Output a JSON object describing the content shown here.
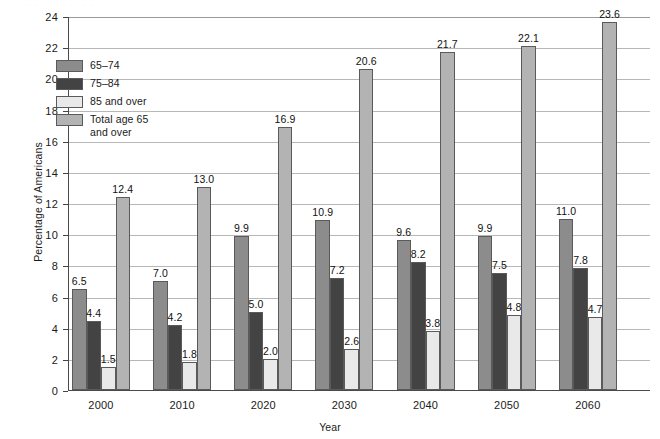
{
  "chart_data": {
    "type": "bar",
    "title": "",
    "xlabel": "Year",
    "ylabel": "Percentage of Americans",
    "categories": [
      "2000",
      "2010",
      "2020",
      "2030",
      "2040",
      "2050",
      "2060"
    ],
    "series": [
      {
        "name": "65–74",
        "values": [
          6.5,
          7.0,
          9.9,
          10.9,
          9.6,
          9.9,
          11.0
        ],
        "color": "#8c8c8c"
      },
      {
        "name": "75–84",
        "values": [
          4.4,
          4.2,
          5.0,
          7.2,
          8.2,
          7.5,
          7.8
        ],
        "color": "#434343"
      },
      {
        "name": "85 and over",
        "values": [
          1.5,
          1.8,
          2.0,
          2.6,
          3.8,
          4.8,
          4.7
        ],
        "color": "#e9e9e9"
      },
      {
        "name": "Total age 65\nand over",
        "values": [
          12.4,
          13.0,
          16.9,
          20.6,
          21.7,
          22.1,
          23.6
        ],
        "color": "#b3b3b3"
      }
    ],
    "ylim": [
      0,
      24
    ],
    "yticks": [
      0,
      2,
      4,
      6,
      8,
      10,
      12,
      14,
      16,
      18,
      20,
      22,
      24
    ],
    "ytick_labels": [
      "0",
      "2",
      "4",
      "6",
      "8",
      "10",
      "12",
      "14",
      "16",
      "18",
      "20",
      "22",
      "24"
    ],
    "grid": true,
    "grid_axis": "y",
    "legend_position": "upper left",
    "data_labels": true,
    "data_label_format": "one-decimal"
  },
  "legend": {
    "entries": [
      {
        "label": "65–74"
      },
      {
        "label": "75–84"
      },
      {
        "label": "85 and over"
      },
      {
        "label": "Total age 65\nand over"
      }
    ]
  },
  "axes": {
    "y_title": "Percentage of Americans",
    "x_title": "Year"
  },
  "artifacts": {
    "top_cut_text": "· · · · · · · · · · ·"
  }
}
